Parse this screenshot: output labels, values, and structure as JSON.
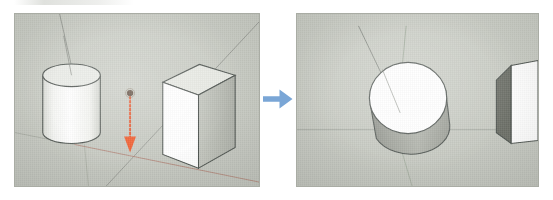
{
  "figure": {
    "type": "before-after-3d-viewport-pair",
    "background_color": "#ffffff"
  },
  "transition": {
    "icon": "arrow-right-icon",
    "direction": "right",
    "color": "#7aa6d6"
  },
  "panels": [
    {
      "id": "before",
      "role": "before-state",
      "background_color": "#c9ccc4",
      "border_color": "#a9aca4",
      "camera": "eye-level perspective",
      "axes": [
        {
          "name": "red-axis",
          "color": "#b06a5c",
          "orientation": "ground-receding-right"
        },
        {
          "name": "green-axis",
          "color": "#8f9c8a",
          "orientation": "ground-receding-left"
        },
        {
          "name": "blue-axis",
          "color": "#808880",
          "orientation": "vertical"
        }
      ],
      "objects": [
        {
          "name": "cylinder",
          "shape": "cylinder",
          "position": "left",
          "top_face_color": "#e9ebe6",
          "side_face_color": "#ffffff",
          "edge_color": "#4e5450"
        },
        {
          "name": "cube",
          "shape": "cube",
          "position": "right",
          "front_face_color": "#ffffff",
          "top_face_color": "#e6e8e2",
          "side_face_color": "#b9bcb4",
          "edge_color": "#4e5450"
        }
      ],
      "annotation": {
        "name": "move-arrow",
        "style": "dotted-vertical-arrow",
        "direction": "down",
        "color": "#e8542a",
        "endpoint_marker": "inference-point-dot",
        "endpoint_marker_color": "#5d4a3c"
      }
    },
    {
      "id": "after",
      "role": "after-state",
      "background_color": "#c9ccc4",
      "border_color": "#a9aca4",
      "camera": "raised / top-down orbit",
      "axes": [
        {
          "name": "red-axis",
          "color": "#9a9e96",
          "orientation": "ground-horizontal"
        },
        {
          "name": "green-axis",
          "color": "#8f9c8a",
          "orientation": "vertical-receding"
        },
        {
          "name": "blue-axis",
          "color": "#808880",
          "orientation": "diagonal-receding"
        }
      ],
      "objects": [
        {
          "name": "cylinder",
          "shape": "cylinder",
          "position": "center",
          "top_face_color": "#ffffff",
          "side_face_color": "#a7aaa2",
          "edge_color": "#4e5450"
        },
        {
          "name": "cube",
          "shape": "cube",
          "position": "right-clipped",
          "front_face_color": "#ffffff",
          "side_face_color": "#6d7068",
          "edge_color": "#4e5450"
        }
      ]
    }
  ]
}
